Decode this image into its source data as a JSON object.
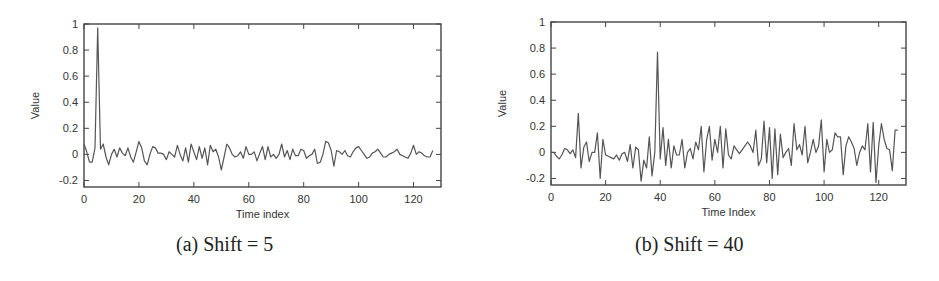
{
  "figures": [
    {
      "caption": "(a) Shift = 5",
      "xlabel": "Time index",
      "ylabel": "Value"
    },
    {
      "caption": "(b) Shift = 40",
      "xlabel": "Time Index",
      "ylabel": "Value"
    }
  ],
  "chart_data": [
    {
      "type": "line",
      "title": "(a) Shift = 5",
      "xlabel": "Time index",
      "ylabel": "Value",
      "xlim": [
        0,
        130
      ],
      "ylim": [
        -0.25,
        1
      ],
      "xticks": [
        0,
        20,
        40,
        60,
        80,
        100,
        120
      ],
      "yticks": [
        -0.2,
        0,
        0.2,
        0.4,
        0.6,
        0.8,
        1
      ],
      "ytick_labels": [
        "-0.2",
        "0",
        "0.2",
        "0.4",
        "0.6",
        "0.8",
        "1"
      ],
      "grid": false,
      "legend": null,
      "line_color": "#555555",
      "x": [
        0,
        1,
        2,
        3,
        4,
        5,
        6,
        7,
        8,
        9,
        10,
        11,
        12,
        13,
        14,
        15,
        16,
        17,
        18,
        19,
        20,
        21,
        22,
        23,
        24,
        25,
        26,
        27,
        28,
        29,
        30,
        31,
        32,
        33,
        34,
        35,
        36,
        37,
        38,
        39,
        40,
        41,
        42,
        43,
        44,
        45,
        46,
        47,
        48,
        49,
        50,
        51,
        52,
        53,
        54,
        55,
        56,
        57,
        58,
        59,
        60,
        61,
        62,
        63,
        64,
        65,
        66,
        67,
        68,
        69,
        70,
        71,
        72,
        73,
        74,
        75,
        76,
        77,
        78,
        79,
        80,
        81,
        82,
        83,
        84,
        85,
        86,
        87,
        88,
        89,
        90,
        91,
        92,
        93,
        94,
        95,
        96,
        97,
        98,
        99,
        100,
        101,
        102,
        103,
        104,
        105,
        106,
        107,
        108,
        109,
        110,
        111,
        112,
        113,
        114,
        115,
        116,
        117,
        118,
        119,
        120,
        121,
        122,
        123,
        124,
        125,
        126,
        127
      ],
      "values": [
        0.08,
        0.02,
        -0.06,
        -0.06,
        0.05,
        0.97,
        0.04,
        0.08,
        -0.02,
        -0.08,
        0.0,
        0.04,
        -0.02,
        0.05,
        0.01,
        -0.01,
        0.05,
        -0.02,
        -0.06,
        0.02,
        0.1,
        0.05,
        -0.05,
        -0.08,
        0.0,
        0.06,
        0.05,
        0.01,
        0.01,
        0.0,
        -0.04,
        0.02,
        0.0,
        -0.02,
        0.07,
        0.0,
        -0.05,
        0.05,
        -0.06,
        0.08,
        0.02,
        -0.04,
        0.06,
        -0.03,
        0.05,
        -0.08,
        0.07,
        0.02,
        0.04,
        -0.02,
        -0.12,
        -0.02,
        0.08,
        0.05,
        0.0,
        -0.02,
        -0.01,
        0.02,
        -0.03,
        0.06,
        0.0,
        0.0,
        0.02,
        -0.05,
        0.01,
        0.06,
        -0.04,
        0.06,
        -0.02,
        0.0,
        -0.03,
        0.0,
        0.08,
        -0.02,
        0.03,
        -0.04,
        0.04,
        -0.01,
        -0.01,
        0.04,
        0.03,
        -0.03,
        -0.01,
        0.0,
        0.04,
        -0.07,
        -0.06,
        0.0,
        0.1,
        0.09,
        0.03,
        -0.09,
        0.03,
        0.02,
        0.0,
        0.03,
        -0.01,
        -0.02,
        0.02,
        0.05,
        0.06,
        0.03,
        0.0,
        -0.03,
        -0.02,
        0.01,
        0.02,
        0.04,
        0.01,
        -0.02,
        -0.02,
        0.0,
        0.01,
        0.02,
        0.04,
        0.0,
        -0.01,
        -0.02,
        -0.03,
        0.01,
        0.07,
        0.0,
        0.02,
        0.01,
        -0.01,
        -0.02,
        -0.02,
        0.03
      ]
    },
    {
      "type": "line",
      "title": "(b) Shift = 40",
      "xlabel": "Time Index",
      "ylabel": "Value",
      "xlim": [
        0,
        130
      ],
      "ylim": [
        -0.25,
        1
      ],
      "xticks": [
        0,
        20,
        40,
        60,
        80,
        100,
        120
      ],
      "yticks": [
        -0.2,
        0,
        0.2,
        0.4,
        0.6,
        0.8,
        1
      ],
      "ytick_labels": [
        "-0.2",
        "0",
        "0.2",
        "0.4",
        "0.6",
        "0.8",
        "1"
      ],
      "grid": false,
      "legend": null,
      "line_color": "#555555",
      "x": [
        0,
        1,
        2,
        3,
        4,
        5,
        6,
        7,
        8,
        9,
        10,
        11,
        12,
        13,
        14,
        15,
        16,
        17,
        18,
        19,
        20,
        21,
        22,
        23,
        24,
        25,
        26,
        27,
        28,
        29,
        30,
        31,
        32,
        33,
        34,
        35,
        36,
        37,
        38,
        39,
        40,
        41,
        42,
        43,
        44,
        45,
        46,
        47,
        48,
        49,
        50,
        51,
        52,
        53,
        54,
        55,
        56,
        57,
        58,
        59,
        60,
        61,
        62,
        63,
        64,
        65,
        66,
        67,
        68,
        69,
        70,
        71,
        72,
        73,
        74,
        75,
        76,
        77,
        78,
        79,
        80,
        81,
        82,
        83,
        84,
        85,
        86,
        87,
        88,
        89,
        90,
        91,
        92,
        93,
        94,
        95,
        96,
        97,
        98,
        99,
        100,
        101,
        102,
        103,
        104,
        105,
        106,
        107,
        108,
        109,
        110,
        111,
        112,
        113,
        114,
        115,
        116,
        117,
        118,
        119,
        120,
        121,
        122,
        123,
        124,
        125,
        126,
        127
      ],
      "values": [
        0.0,
        0.0,
        -0.03,
        -0.05,
        -0.02,
        0.03,
        0.02,
        -0.01,
        0.02,
        -0.04,
        0.3,
        -0.12,
        0.04,
        0.08,
        -0.07,
        0.0,
        0.0,
        0.15,
        -0.2,
        0.1,
        -0.02,
        -0.03,
        -0.04,
        -0.05,
        -0.02,
        -0.06,
        -0.01,
        0.0,
        -0.07,
        0.06,
        -0.12,
        0.04,
        0.02,
        -0.22,
        -0.06,
        -0.12,
        0.12,
        -0.18,
        0.0,
        0.77,
        -0.05,
        0.19,
        -0.1,
        0.1,
        -0.12,
        0.05,
        -0.02,
        -0.02,
        0.1,
        -0.12,
        0.0,
        0.03,
        -0.05,
        0.08,
        0.02,
        0.2,
        -0.15,
        0.1,
        0.2,
        -0.06,
        0.1,
        0.0,
        0.2,
        -0.12,
        0.18,
        -0.02,
        -0.05,
        0.05,
        0.02,
        -0.01,
        0.02,
        0.05,
        0.08,
        0.05,
        0.0,
        0.17,
        -0.1,
        -0.05,
        0.24,
        -0.08,
        0.19,
        -0.2,
        0.18,
        -0.17,
        0.14,
        -0.04,
        0.0,
        0.03,
        -0.1,
        0.22,
        0.02,
        0.06,
        -0.02,
        0.2,
        -0.08,
        0.0,
        0.1,
        0.0,
        0.05,
        0.25,
        -0.15,
        0.1,
        0.0,
        0.02,
        0.15,
        0.12,
        0.12,
        -0.17,
        0.05,
        0.12,
        0.08,
        0.03,
        -0.1,
        0.0,
        0.05,
        0.02,
        0.22,
        -0.15,
        0.23,
        -0.23,
        0.05,
        0.22,
        0.1,
        0.03,
        0.02,
        -0.14,
        0.17,
        0.17
      ]
    }
  ]
}
